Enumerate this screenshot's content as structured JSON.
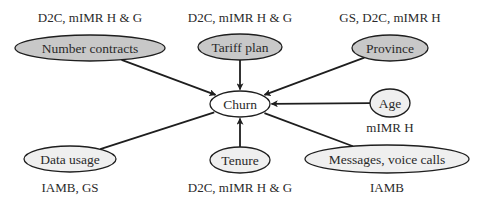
{
  "diagram": {
    "type": "causal-graph",
    "colors": {
      "background": "#ffffff",
      "edge": "#1e1e1e",
      "node_stroke": "#1e1e1e",
      "fill_dark": "#c8c8c8",
      "fill_light": "#efefef",
      "fill_center": "#ffffff",
      "text": "#2a2a2a"
    },
    "center_node": {
      "id": "churn",
      "label": "Churn",
      "cx": 240,
      "cy": 104,
      "rx": 30,
      "ry": 13
    },
    "nodes": [
      {
        "id": "number-contracts",
        "label": "Number contracts",
        "cx": 90,
        "cy": 48,
        "rx": 75,
        "ry": 13,
        "fill": "dark",
        "methods": "D2C, mIMR H & G",
        "methods_x": 90,
        "methods_y": 22,
        "edge": "directed"
      },
      {
        "id": "tariff-plan",
        "label": "Tariff plan",
        "cx": 240,
        "cy": 47,
        "rx": 42,
        "ry": 13,
        "fill": "dark",
        "methods": "D2C, mIMR H & G",
        "methods_x": 240,
        "methods_y": 22,
        "edge": "directed"
      },
      {
        "id": "province",
        "label": "Province",
        "cx": 390,
        "cy": 48,
        "rx": 38,
        "ry": 13,
        "fill": "dark",
        "methods": "GS, D2C, mIMR H",
        "methods_x": 390,
        "methods_y": 22,
        "edge": "directed"
      },
      {
        "id": "age",
        "label": "Age",
        "cx": 390,
        "cy": 103,
        "rx": 20,
        "ry": 14,
        "fill": "light",
        "methods": "mIMR H",
        "methods_x": 390,
        "methods_y": 132,
        "edge": "directed"
      },
      {
        "id": "data-usage",
        "label": "Data usage",
        "cx": 70,
        "cy": 159,
        "rx": 46,
        "ry": 13,
        "fill": "light",
        "methods": "IAMB, GS",
        "methods_x": 70,
        "methods_y": 192,
        "edge": "undirected"
      },
      {
        "id": "tenure",
        "label": "Tenure",
        "cx": 240,
        "cy": 160,
        "rx": 30,
        "ry": 13,
        "fill": "light",
        "methods": "D2C, mIMR H & G",
        "methods_x": 240,
        "methods_y": 192,
        "edge": "directed"
      },
      {
        "id": "messages-voice-calls",
        "label": "Messages, voice calls",
        "cx": 387,
        "cy": 159,
        "rx": 82,
        "ry": 14,
        "fill": "light",
        "methods": "IAMB",
        "methods_x": 387,
        "methods_y": 192,
        "edge": "undirected"
      }
    ]
  }
}
